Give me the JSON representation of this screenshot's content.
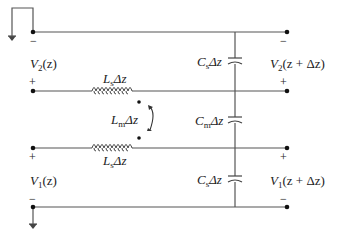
{
  "diagram": {
    "labels": {
      "v2_left": {
        "main": "V",
        "sub": "2",
        "arg": "(z)"
      },
      "v1_left": {
        "main": "V",
        "sub": "1",
        "arg": "(z)"
      },
      "v2_right": {
        "main": "V",
        "sub": "2",
        "arg": "(z + Δz)"
      },
      "v1_right": {
        "main": "V",
        "sub": "1",
        "arg": "(z + Δz)"
      },
      "ls_top": {
        "main": "L",
        "sub": "s",
        "rest": "Δz"
      },
      "ls_bottom": {
        "main": "L",
        "sub": "s",
        "rest": "Δz"
      },
      "lm": {
        "main": "L",
        "sub": "m",
        "rest": "Δz"
      },
      "cs_top": {
        "main": "C",
        "sub": "s",
        "rest": "Δz"
      },
      "cm": {
        "main": "C",
        "sub": "m",
        "rest": "Δz"
      },
      "cs_bottom": {
        "main": "C",
        "sub": "s",
        "rest": "Δz"
      }
    },
    "signs": {
      "plus": "+",
      "minus": "−"
    },
    "colors": {
      "wire": "#555555",
      "text": "#222222",
      "node": "#111111"
    }
  }
}
